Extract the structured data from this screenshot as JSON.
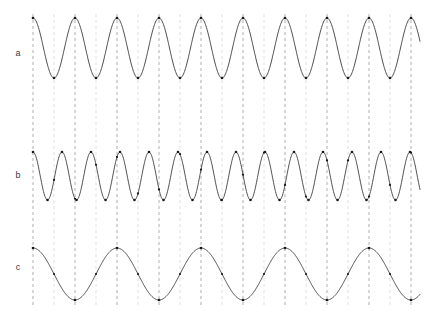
{
  "figure": {
    "width": 433,
    "height": 311,
    "background_color": "#ffffff",
    "title": "",
    "row_labels": [
      {
        "id": "a",
        "text": "a",
        "x": 18,
        "y": 54
      },
      {
        "id": "b",
        "text": "b",
        "x": 18,
        "y": 176
      },
      {
        "id": "c",
        "text": "c",
        "x": 18,
        "y": 268
      }
    ]
  },
  "style": {
    "wave_stroke_color": "#3c3c3c",
    "wave_stroke_width": 0.9,
    "marker_color": "#1a1a1a",
    "marker_radius": 1.3,
    "guide_dark_color": "#9a9a9a",
    "guide_light_color": "#d8d8d8",
    "label_color": "#3a3a3a",
    "label_font_size": 9
  },
  "guides": {
    "description": "vertical dashed reference lines spanning full plot height, alternating dark and light gray",
    "y_top": 14,
    "y_bottom": 305,
    "start_x": 33,
    "spacing": 21,
    "count": 19,
    "dash_pattern": "3 3",
    "alternating": true
  },
  "chart_data": {
    "type": "line",
    "title": "",
    "xlabel": "",
    "ylabel": "",
    "x_range": [
      33,
      420
    ],
    "grid": true,
    "legend_position": "left",
    "series": [
      {
        "name": "a",
        "label": "a",
        "waveform": "cosine",
        "period_px": 42,
        "cycles": 9.3,
        "phase_deg": 0,
        "amplitude_px": 30,
        "baseline_y": 48,
        "y_peak": 18,
        "y_trough": 78,
        "x_start": 33,
        "x_end": 420,
        "marker_extrema": true,
        "marker_on_guides": true
      },
      {
        "name": "b",
        "label": "b",
        "waveform": "cosine",
        "period_px": 29,
        "cycles": 13.4,
        "phase_deg": 0,
        "amplitude_px": 24,
        "baseline_y": 176,
        "y_peak": 152,
        "y_trough": 200,
        "x_start": 33,
        "x_end": 420,
        "marker_extrema": true,
        "marker_on_guides": true
      },
      {
        "name": "c",
        "label": "c",
        "waveform": "cosine",
        "period_px": 84,
        "cycles": 4.65,
        "phase_deg": 0,
        "amplitude_px": 26,
        "baseline_y": 274,
        "y_peak": 248,
        "y_trough": 300,
        "x_start": 33,
        "x_end": 420,
        "marker_extrema": true,
        "marker_on_guides": true
      }
    ]
  }
}
